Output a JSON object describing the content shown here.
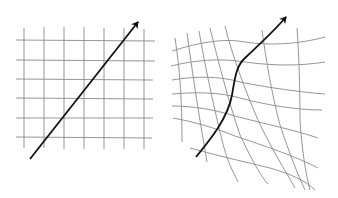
{
  "figure": {
    "panels": [
      {
        "id": "flat",
        "label": "Regular grid",
        "grid_columns": 7,
        "grid_rows": 6,
        "arrow": "straight"
      },
      {
        "id": "warped",
        "label": "Warped grid",
        "grid_columns": 9,
        "grid_rows": 7,
        "arrow": "curved"
      }
    ],
    "colors": {
      "grid": "#8a8a8a",
      "arrow": "#111111",
      "background": "#ffffff"
    }
  }
}
